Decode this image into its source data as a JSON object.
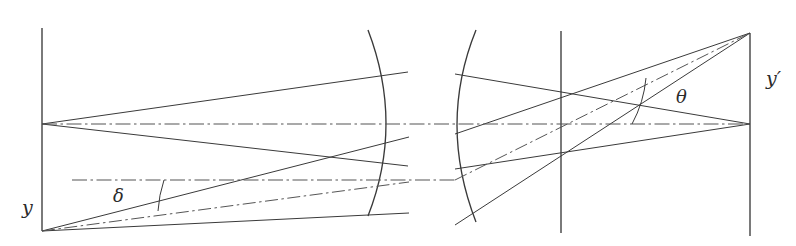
{
  "figure": {
    "kind": "optical-ray-diagram",
    "width": 796,
    "height": 246,
    "background_color": "#ffffff",
    "line_color": "#3a3a3a",
    "axis_color": "#555555",
    "label_color": "#2b2b2b"
  },
  "labels": {
    "object_height": {
      "text": "y",
      "x": 22,
      "y": 214,
      "font_size": 19,
      "description": "object height label at left plane"
    },
    "image_height": {
      "text": "y′",
      "x": 766,
      "y": 85,
      "font_size": 19,
      "description": "image height label at right plane"
    },
    "object_angle": {
      "text": "δ",
      "x": 113,
      "y": 202,
      "font_size": 18,
      "description": "delta, field angle in object space"
    },
    "image_angle": {
      "text": "θ",
      "x": 676,
      "y": 103,
      "font_size": 18,
      "description": "theta, field angle in image space"
    }
  },
  "planes": {
    "object_plane": {
      "name": "object-plane",
      "x": 42,
      "y_top": 28,
      "y_bottom": 231
    },
    "stop_plane": {
      "name": "stop-plane",
      "x": 561,
      "y_top": 31,
      "y_bottom": 233
    },
    "image_plane": {
      "name": "image-plane",
      "x": 750,
      "y_top": 33,
      "y_bottom": 236
    }
  },
  "axes": {
    "optical_axis": {
      "name": "optical-axis",
      "y": 124,
      "x_start": 42,
      "x_end": 752,
      "style": "dash-dot"
    },
    "auxiliary_axis": {
      "name": "auxiliary-axis",
      "y": 180,
      "x_start": 72,
      "x_end": 456,
      "style": "dash-dot"
    }
  },
  "lens_surfaces": [
    {
      "name": "left-surface",
      "x_edge": 368,
      "x_vertex": 393,
      "y_top": 30,
      "y_bottom": 216,
      "bulge": "right"
    },
    {
      "name": "right-surface",
      "x_edge": 476,
      "x_vertex": 449,
      "y_top": 30,
      "y_bottom": 222,
      "bulge": "left"
    }
  ],
  "points": {
    "axial_object": {
      "x": 42,
      "y": 124
    },
    "off_axis_object": {
      "x": 42,
      "y": 231
    },
    "axial_image": {
      "x": 750,
      "y": 124
    },
    "off_axis_image": {
      "x": 750,
      "y": 33
    },
    "pupil_upper": {
      "x": 561,
      "y": 96
    },
    "pupil_lower": {
      "x": 561,
      "y": 157
    },
    "pupil_center": {
      "x": 561,
      "y": 126
    }
  },
  "ray_bundles": [
    {
      "name": "axial-bundle-object-side",
      "origin": {
        "x": 42,
        "y": 124
      },
      "rays": [
        {
          "name": "upper-marginal",
          "to": {
            "x": 408,
            "y": 72
          }
        },
        {
          "name": "lower-marginal",
          "to": {
            "x": 408,
            "y": 166
          }
        },
        {
          "name": "chief-axis",
          "to": {
            "x": 408,
            "y": 124
          }
        }
      ]
    },
    {
      "name": "off-axis-bundle-object-side",
      "origin": {
        "x": 42,
        "y": 231
      },
      "rays": [
        {
          "name": "upper-marginal",
          "to": {
            "x": 409,
            "y": 137
          }
        },
        {
          "name": "lower-marginal",
          "to": {
            "x": 409,
            "y": 213
          }
        },
        {
          "name": "chief-ray",
          "to": {
            "x": 409,
            "y": 182
          }
        }
      ]
    },
    {
      "name": "axial-bundle-image-side",
      "target": {
        "x": 750,
        "y": 124
      },
      "rays": [
        {
          "name": "upper-marginal",
          "from": {
            "x": 455,
            "y": 74
          }
        },
        {
          "name": "lower-marginal",
          "from": {
            "x": 455,
            "y": 169
          }
        },
        {
          "name": "chief-axis",
          "from": {
            "x": 455,
            "y": 124
          }
        }
      ]
    },
    {
      "name": "off-axis-bundle-image-side",
      "target": {
        "x": 750,
        "y": 33
      },
      "rays": [
        {
          "name": "upper-marginal",
          "from": {
            "x": 455,
            "y": 134
          }
        },
        {
          "name": "lower-marginal",
          "from": {
            "x": 455,
            "y": 225
          }
        },
        {
          "name": "chief-ray",
          "from": {
            "x": 455,
            "y": 180
          }
        }
      ]
    }
  ],
  "angle_arcs": [
    {
      "name": "delta-arc",
      "vertex": {
        "x": 42,
        "y": 231
      },
      "radius": 122,
      "from_label": "auxiliary-axis",
      "to_label": "chief-ray"
    },
    {
      "name": "theta-arc",
      "vertex": {
        "x": 750,
        "y": 124
      },
      "radius": 118,
      "from_label": "optical-axis",
      "to_label": "chief-ray"
    }
  ]
}
